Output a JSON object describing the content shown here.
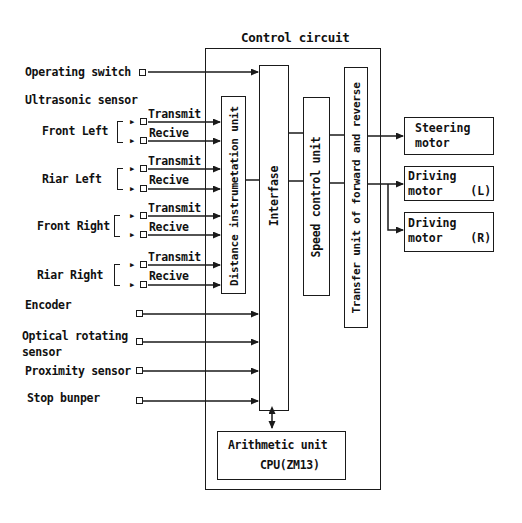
{
  "title": "Control circuit",
  "inputs": {
    "operating_switch": "Operating switch",
    "ultrasonic_header": "Ultrasonic sensor",
    "sensor_groups": [
      {
        "name": "Front Left",
        "transmit": "Transmit",
        "receive": "Recive"
      },
      {
        "name": "Riar Left",
        "transmit": "Transmit",
        "receive": "Recive"
      },
      {
        "name": "Front Right",
        "transmit": "Transmit",
        "receive": "Recive"
      },
      {
        "name": "Riar Right",
        "transmit": "Transmit",
        "receive": "Recive"
      }
    ],
    "encoder": "Encoder",
    "optical_line1": "Optical rotating",
    "optical_line2": "sensor",
    "proximity": "Proximity sensor",
    "stop_bumper": "Stop bunper"
  },
  "units": {
    "distance": "Distance instrumetation unit",
    "interface": "Interfase",
    "speed": "Speed control unit",
    "transfer": "Transfer unit of forward and reverse",
    "arithmetic_line1": "Arithmetic unit",
    "arithmetic_line2": "CPU(ZM13)"
  },
  "outputs": {
    "steering": "Steering\nmotor",
    "driving_left": "Driving\nmotor    (L)",
    "driving_right": "Driving\nmotor    (R)"
  }
}
